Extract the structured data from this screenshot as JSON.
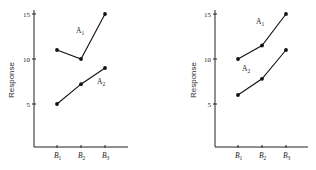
{
  "chart_data": [
    {
      "type": "line",
      "title": "",
      "xlabel": "",
      "ylabel": "Response",
      "categories": [
        "B1",
        "B2",
        "B3"
      ],
      "category_labels": [
        {
          "base": "B",
          "sub": "1"
        },
        {
          "base": "B",
          "sub": "2"
        },
        {
          "base": "B",
          "sub": "3"
        }
      ],
      "yticks": [
        5,
        10,
        15
      ],
      "ylim": [
        0,
        16
      ],
      "grid": false,
      "legend": "inline",
      "series": [
        {
          "name": "A1",
          "label_base": "A",
          "label_sub": "1",
          "values": [
            11,
            10,
            15
          ]
        },
        {
          "name": "A2",
          "label_base": "A",
          "label_sub": "2",
          "values": [
            5,
            7.2,
            9
          ]
        }
      ]
    },
    {
      "type": "line",
      "title": "",
      "xlabel": "",
      "ylabel": "Response",
      "categories": [
        "B1",
        "B2",
        "B3"
      ],
      "category_labels": [
        {
          "base": "B",
          "sub": "1"
        },
        {
          "base": "B",
          "sub": "2"
        },
        {
          "base": "B",
          "sub": "3"
        }
      ],
      "yticks": [
        5,
        10,
        15
      ],
      "ylim": [
        0,
        16
      ],
      "grid": false,
      "legend": "inline",
      "series": [
        {
          "name": "A1",
          "label_base": "A",
          "label_sub": "1",
          "values": [
            10,
            11.5,
            15
          ]
        },
        {
          "name": "A2",
          "label_base": "A",
          "label_sub": "2",
          "values": [
            6,
            7.8,
            11
          ]
        }
      ]
    }
  ]
}
